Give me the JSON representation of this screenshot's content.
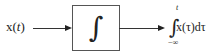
{
  "diagram": {
    "type": "block-diagram",
    "input": {
      "label": "x(t)",
      "func": "x(",
      "var": "t",
      "close": ")"
    },
    "block": {
      "symbol": "∫",
      "operation": "integrator"
    },
    "output": {
      "integral_sign": "∫",
      "upper_limit": "t",
      "lower_limit": "−∞",
      "integrand": "x(τ)dτ"
    },
    "colors": {
      "stroke": "#333333",
      "background": "#ffffff"
    }
  }
}
